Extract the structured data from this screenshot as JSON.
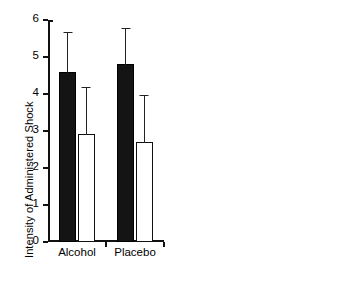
{
  "figure": {
    "background": "#ffffff",
    "ink": "#000000"
  },
  "chart_data": [
    {
      "type": "bar",
      "panel": "left",
      "title": "",
      "xlabel": "",
      "ylabel": "Intensity of Administered Shock",
      "categories": [
        "Alcohol",
        "Placebo"
      ],
      "ylim": [
        0,
        6
      ],
      "yticks": [
        0,
        1,
        2,
        3,
        4,
        5,
        6
      ],
      "ytick_labels": [
        "0",
        "1",
        "2",
        "3",
        "4",
        "5",
        "6"
      ],
      "grid": false,
      "legend": "none",
      "series": [
        {
          "name": "filled",
          "fill": "#141414",
          "values": [
            4.6,
            4.82
          ],
          "error_upper": [
            1.05,
            0.93
          ]
        },
        {
          "name": "open",
          "fill": "#ffffff",
          "values": [
            2.93,
            2.7
          ],
          "error_upper": [
            1.22,
            1.25
          ]
        }
      ]
    },
    {
      "type": "bar",
      "panel": "right",
      "title": "",
      "xlabel": "",
      "ylabel": "Response Latency in Seconds",
      "categories": [
        "Alcohol",
        "Placebo"
      ],
      "ylim": [
        0,
        1.5
      ],
      "yticks": [
        0,
        0.5,
        1.0,
        1.5
      ],
      "ytick_labels": [
        "0",
        "0.5",
        "1.0",
        "1.5"
      ],
      "grid": false,
      "legend": "none",
      "series": [
        {
          "name": "filled",
          "fill": "#141414",
          "values": [
            1.19,
            1.02
          ],
          "error_upper": [
            0.21,
            0.12
          ]
        },
        {
          "name": "open",
          "fill": "#ffffff",
          "values": [
            1.16,
            1.02
          ],
          "error_upper": [
            0.26,
            0.14
          ]
        }
      ]
    }
  ]
}
